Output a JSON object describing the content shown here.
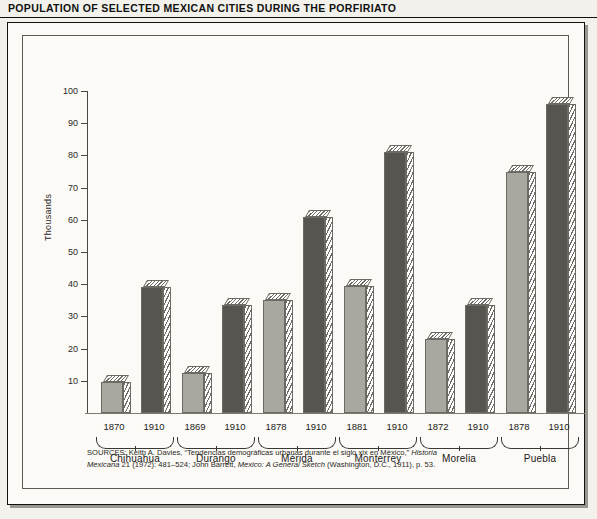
{
  "title": "POPULATION OF SELECTED MEXICAN CITIES DURING THE PORFIRIATO",
  "axis": {
    "ylabel": "Thousands",
    "yticks": [
      10,
      20,
      30,
      40,
      50,
      60,
      70,
      80,
      90,
      100
    ],
    "ymin": 0,
    "ymax": 100
  },
  "colors": {
    "early_bar": "#a9a7a0",
    "later_bar": "#575550",
    "outline": "#6d6a63",
    "panel_background": "#fbfaf6",
    "page_background": "#f3f1ec"
  },
  "source": {
    "line1_prefix": "SOURCES:",
    "line1": " Keith A. Davies, “Tendencias demográficas urbanas durante el siglo xix en México,” ",
    "line1_italic": "Historia",
    "line2_italic_a": "Mexicana",
    "line2_mid": " 21 (1972): 481–524; John Barrett, ",
    "line2_italic_b": "Mexico: A General Sketch",
    "line2_end": " (Washington, D.C., 1911), p. 53."
  },
  "chart_data": {
    "type": "bar",
    "title": "POPULATION OF SELECTED MEXICAN CITIES DURING THE PORFIRIATO",
    "xlabel": "",
    "ylabel": "Thousands",
    "ylim": [
      0,
      100
    ],
    "grid": false,
    "legend": "none",
    "units": "thousands of inhabitants",
    "categories": [
      "Chihuahua",
      "Durango",
      "Mérida",
      "Monterrey",
      "Morelia",
      "Puebla"
    ],
    "groups": [
      {
        "city": "Chihuahua",
        "bars": [
          {
            "year": "1870",
            "value": 9.5,
            "style": "light"
          },
          {
            "year": "1910",
            "value": 39,
            "style": "dark"
          }
        ]
      },
      {
        "city": "Durango",
        "bars": [
          {
            "year": "1869",
            "value": 12.5,
            "style": "light"
          },
          {
            "year": "1910",
            "value": 33.5,
            "style": "dark"
          }
        ]
      },
      {
        "city": "Mérida",
        "bars": [
          {
            "year": "1878",
            "value": 35,
            "style": "light"
          },
          {
            "year": "1910",
            "value": 61,
            "style": "dark"
          }
        ]
      },
      {
        "city": "Monterrey",
        "bars": [
          {
            "year": "1881",
            "value": 39.5,
            "style": "light"
          },
          {
            "year": "1910",
            "value": 81,
            "style": "dark"
          }
        ]
      },
      {
        "city": "Morelia",
        "bars": [
          {
            "year": "1872",
            "value": 23,
            "style": "light"
          },
          {
            "year": "1910",
            "value": 33.5,
            "style": "dark"
          }
        ]
      },
      {
        "city": "Puebla",
        "bars": [
          {
            "year": "1878",
            "value": 75,
            "style": "light"
          },
          {
            "year": "1910",
            "value": 96,
            "style": "dark"
          }
        ]
      }
    ]
  }
}
